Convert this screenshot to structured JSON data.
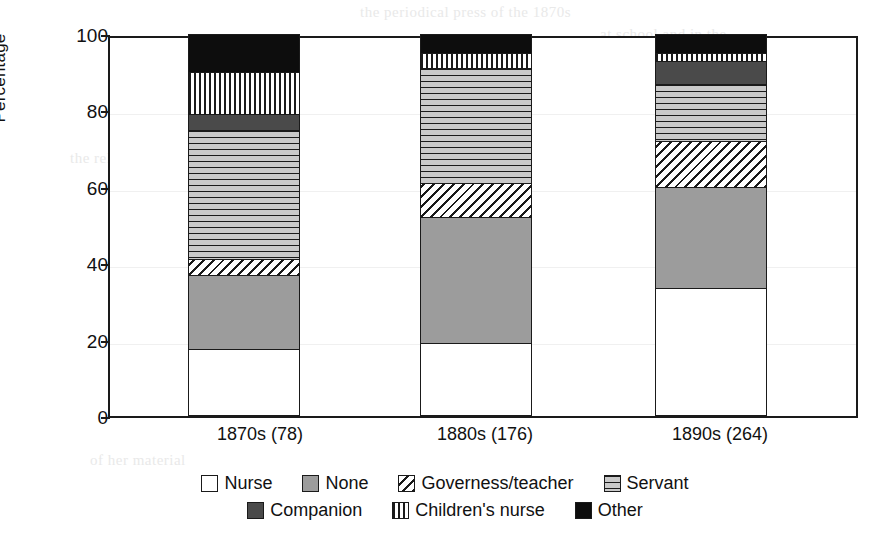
{
  "chart_data": {
    "type": "bar",
    "subtype": "stacked-100-percent",
    "title": "",
    "xlabel": "",
    "ylabel": "Percentage",
    "ylim": [
      0,
      100
    ],
    "yticks": [
      0,
      20,
      40,
      60,
      80,
      100
    ],
    "ytick_labels": [
      "0",
      "20",
      "40",
      "60",
      "80",
      "100"
    ],
    "grid": false,
    "legend_position": "bottom",
    "categories": [
      "1870s (78)",
      "1880s (176)",
      "1890s (264)"
    ],
    "series": [
      {
        "name": "Nurse",
        "pattern": "white",
        "values": [
          17.5,
          19.0,
          33.5
        ]
      },
      {
        "name": "None",
        "pattern": "solid-gray",
        "values": [
          19.5,
          33.0,
          26.5
        ]
      },
      {
        "name": "Governess/teacher",
        "pattern": "diagonal-hatch",
        "values": [
          4.0,
          9.0,
          12.0
        ]
      },
      {
        "name": "Servant",
        "pattern": "horizontal-lines",
        "values": [
          34.0,
          30.0,
          15.0
        ]
      },
      {
        "name": "Companion",
        "pattern": "dark-gray",
        "values": [
          4.0,
          0.0,
          6.0
        ]
      },
      {
        "name": "Children's nurse",
        "pattern": "vertical-lines",
        "values": [
          11.0,
          4.0,
          2.0
        ]
      },
      {
        "name": "Other",
        "pattern": "black",
        "values": [
          10.0,
          5.0,
          5.0
        ]
      }
    ],
    "cumulative_tops": {
      "1870s (78)": [
        17.5,
        37.0,
        41.0,
        75.0,
        79.0,
        90.0,
        100.0
      ],
      "1880s (176)": [
        19.0,
        52.0,
        61.0,
        91.0,
        91.0,
        95.0,
        100.0
      ],
      "1890s (264)": [
        33.5,
        60.0,
        72.0,
        87.0,
        93.0,
        95.0,
        100.0
      ]
    }
  },
  "axis": {
    "y_title": "Percentage",
    "y_ticks": [
      "100",
      "80",
      "60",
      "40",
      "20",
      "0"
    ],
    "x_labels": [
      "1870s (78)",
      "1880s (176)",
      "1890s (264)"
    ]
  },
  "legend": {
    "row1": [
      {
        "label": "Nurse",
        "pattern": "white"
      },
      {
        "label": "None",
        "pattern": "solid-gray"
      },
      {
        "label": "Governess/teacher",
        "pattern": "diagonal-hatch"
      },
      {
        "label": "Servant",
        "pattern": "horizontal-lines"
      }
    ],
    "row2": [
      {
        "label": "Companion",
        "pattern": "dark-gray"
      },
      {
        "label": "Children's nurse",
        "pattern": "vertical-lines"
      },
      {
        "label": "Other",
        "pattern": "black"
      }
    ]
  },
  "colors": {
    "axis": "#1a1a1a",
    "white": "#ffffff",
    "solid_gray": "#9c9c9c",
    "dark_gray": "#4a4a4a",
    "black": "#0d0d0d",
    "page_background": "#ffffff"
  },
  "ghost_text": {
    "lines": [
      "the periodical press of the 1870s",
      "at school and in the",
      "the relative proportions",
      "of her material"
    ]
  }
}
